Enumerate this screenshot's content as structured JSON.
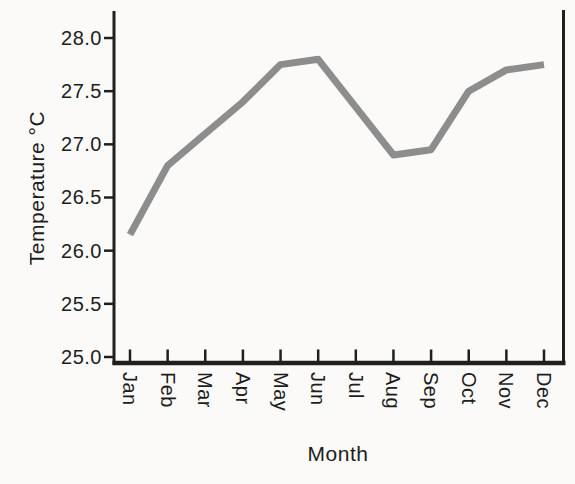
{
  "chart_data": {
    "type": "line",
    "categories": [
      "Jan",
      "Feb",
      "Mar",
      "Apr",
      "May",
      "Jun",
      "Jul",
      "Aug",
      "Sep",
      "Oct",
      "Nov",
      "Dec"
    ],
    "values": [
      26.15,
      26.8,
      27.1,
      27.4,
      27.75,
      27.8,
      27.35,
      26.9,
      26.95,
      27.5,
      27.7,
      27.75
    ],
    "series_name": "Temperature",
    "xlabel": "Month",
    "ylabel": "Temperature °C",
    "ylim": [
      25.0,
      28.0
    ],
    "yticks": [
      28.0,
      27.5,
      27.0,
      26.5,
      26.0,
      25.5,
      25.0
    ],
    "ytick_labels": [
      "28.0",
      "27.5",
      "27.0",
      "26.5",
      "26.0",
      "25.5",
      "25.0"
    ],
    "grid": false,
    "legend": "none",
    "xtick_label_rotation_deg": 90,
    "spines": [
      "left",
      "right",
      "bottom"
    ],
    "line_color": "#8d8d8d",
    "axis_color": "#1f1f1f",
    "background_color": "#fbfaf8"
  }
}
